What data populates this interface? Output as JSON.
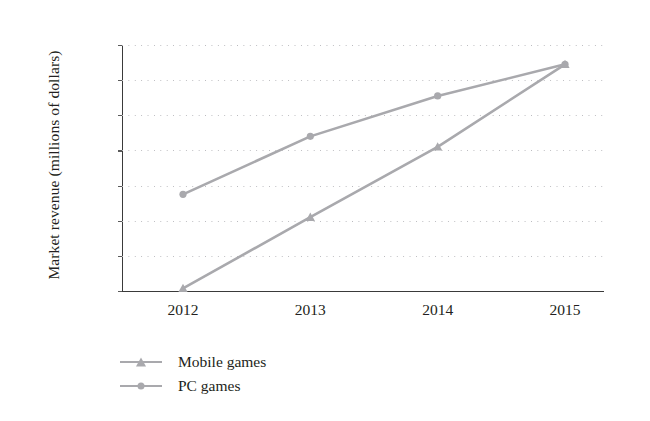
{
  "chart_data": {
    "type": "line",
    "title": "",
    "xlabel": "",
    "ylabel": "Market revenue (millions of dollars)",
    "categories": [
      "2012",
      "2013",
      "2014",
      "2015"
    ],
    "x": [
      2012,
      2013,
      2014,
      2015
    ],
    "ylim": [
      9000,
      23000
    ],
    "ytick_values": [
      23000,
      21000,
      19000,
      17000,
      15000,
      13000,
      11000,
      9000
    ],
    "ytick_labels": [
      "23,000",
      "21,000",
      "19,000",
      "17,000",
      "15,000",
      "13,000",
      "11,000",
      "9,000"
    ],
    "grid": "horizontal-dotted",
    "legend_position": "below-left",
    "series": [
      {
        "name": "Mobile games",
        "marker": "triangle",
        "color": "#a9a9ad",
        "values": [
          9150,
          13200,
          17200,
          21900
        ]
      },
      {
        "name": "PC games",
        "marker": "circle",
        "color": "#a9a9ad",
        "values": [
          14500,
          17800,
          20100,
          21900
        ]
      }
    ]
  },
  "axis": {
    "y_title": "Market revenue (millions of dollars)",
    "axis_color": "#3a3a3a",
    "grid_color": "#b9b9bd"
  },
  "legend": {
    "items": [
      {
        "label": "Mobile games",
        "marker": "triangle-marker-icon"
      },
      {
        "label": "PC games",
        "marker": "circle-marker-icon"
      }
    ]
  }
}
